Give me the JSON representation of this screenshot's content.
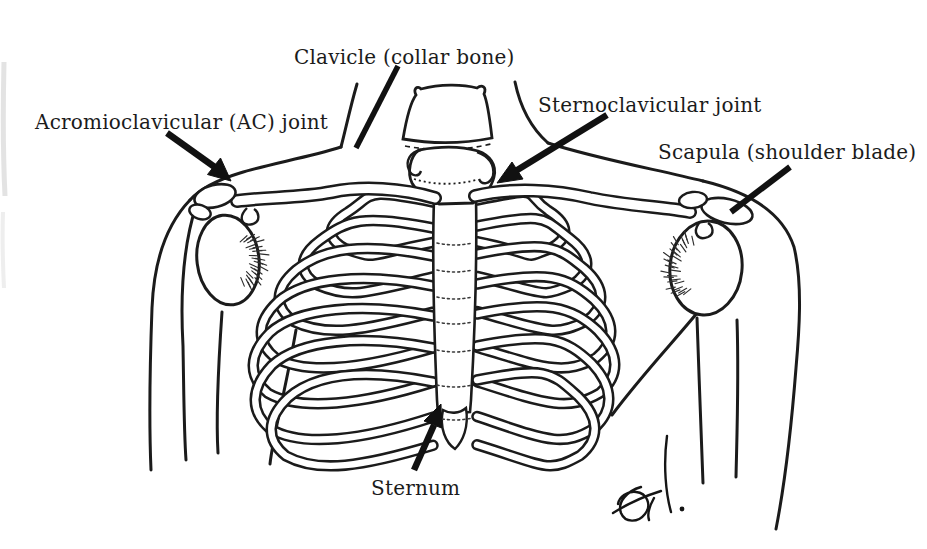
{
  "figure": {
    "kind": "anatomical-line-drawing",
    "labels": {
      "acromioclavicular_joint": "Acromioclavicular (AC) joint",
      "clavicle": "Clavicle (collar bone)",
      "sternoclavicular_joint": "Sternoclavicular joint",
      "scapula": "Scapula (shoulder blade)",
      "sternum": "Sternum"
    },
    "colors": {
      "ink": "#1b1b1b",
      "background": "#ffffff",
      "arrow": "#111111"
    }
  }
}
